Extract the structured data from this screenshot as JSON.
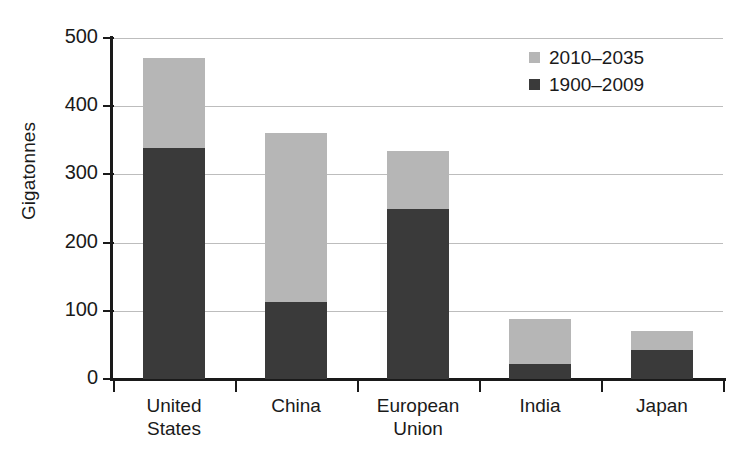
{
  "chart_data": {
    "type": "bar",
    "subtype": "stacked-vertical",
    "title": "",
    "xlabel": "",
    "ylabel": "Gigatonnes",
    "ylim": [
      0,
      500
    ],
    "y_ticks": [
      0,
      100,
      200,
      300,
      400,
      500
    ],
    "y_tick_labels": [
      "0",
      "100",
      "200",
      "300",
      "400",
      "500"
    ],
    "grid": "horizontal",
    "legend_position": "top-right",
    "categories": [
      "United States",
      "China",
      "European Union",
      "India",
      "Japan"
    ],
    "category_label_lines": [
      [
        "United",
        "States"
      ],
      [
        "China"
      ],
      [
        "European",
        "Union"
      ],
      [
        "India"
      ],
      [
        "Japan"
      ]
    ],
    "series": [
      {
        "name": "1900–2009",
        "color": "#3a3a3a",
        "values": [
          338,
          113,
          250,
          22,
          43
        ]
      },
      {
        "name": "2010–2035",
        "color": "#b6b6b6",
        "values": [
          132,
          247,
          85,
          66,
          27
        ]
      }
    ],
    "stack_totals": [
      470,
      360,
      335,
      88,
      70
    ],
    "legend": [
      {
        "label": "2010–2035",
        "color": "#b6b6b6",
        "swatch": "legend-swatch-light"
      },
      {
        "label": "1900–2009",
        "color": "#3a3a3a",
        "swatch": "legend-swatch-dark"
      }
    ]
  },
  "colors": {
    "late_period": "#b6b6b6",
    "early_period": "#3a3a3a",
    "axis": "#1a1a1a",
    "gridline": "#bdbdbd",
    "background": "#ffffff"
  }
}
